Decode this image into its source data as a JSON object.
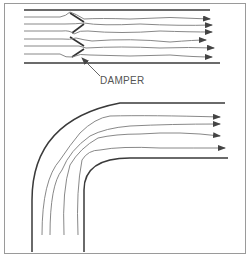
{
  "diagram": {
    "top_panel": {
      "description": "Straight duct with damper blades, airflow streamlines with arrows",
      "label": "DAMPER",
      "arrow_count": 6
    },
    "bottom_panel": {
      "description": "Duct elbow (90-degree bend), airflow streamlines turning with arrows",
      "arrow_count": 4
    },
    "colors": {
      "duct_wall": "#3a3a3a",
      "streamline": "#7a7a7a",
      "arrow": "#444444",
      "frame": "#9a9a9a"
    }
  }
}
